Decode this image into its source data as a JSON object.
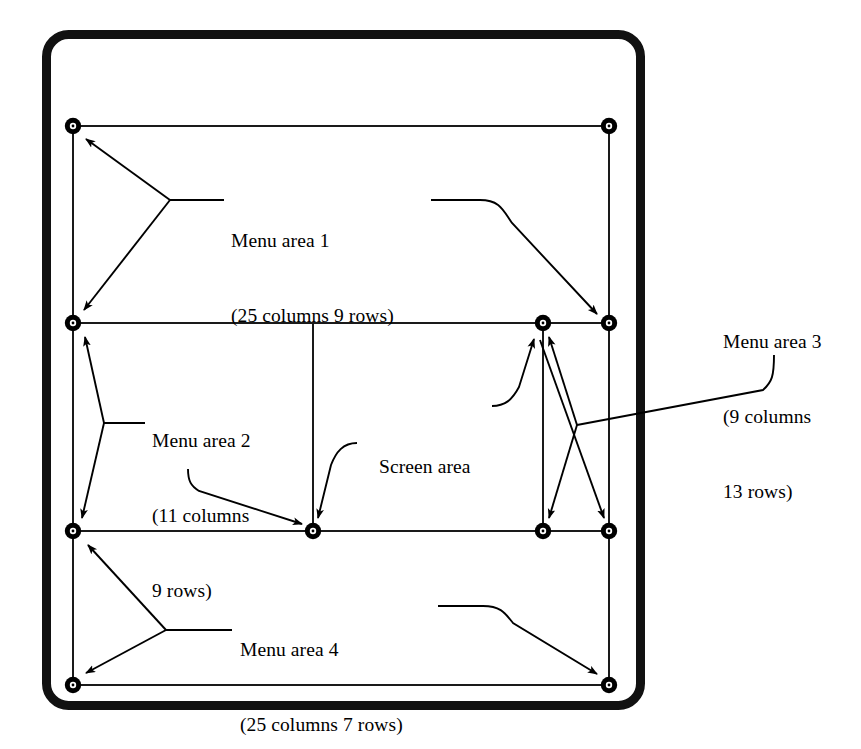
{
  "diagram": {
    "colors": {
      "ink": "#000000",
      "background": "#ffffff",
      "outer_border": "#111111"
    },
    "outer_frame": {
      "shape": "rounded-rectangle",
      "stroke_width_px": 9,
      "corner_radius_px": 22
    },
    "labels": {
      "menu_area_1": {
        "name": "Menu area 1",
        "spec_line_1": "(25 columns 9 rows)",
        "columns": 25,
        "rows": 9
      },
      "menu_area_2": {
        "name": "Menu area 2",
        "spec_line_1": "(11 columns",
        "spec_line_2": "9 rows)",
        "columns": 11,
        "rows": 9
      },
      "menu_area_3": {
        "name": "Menu area 3",
        "spec_line_1": "(9 columns",
        "spec_line_2": "13 rows)",
        "columns": 9,
        "rows": 13
      },
      "menu_area_4": {
        "name": "Menu area 4",
        "spec_line_1": "(25 columns 7 rows)",
        "columns": 25,
        "rows": 7
      },
      "screen_area": {
        "name": "Screen area"
      }
    },
    "grid": {
      "horizontal_rule_y": [
        126,
        323,
        531,
        685
      ],
      "vertical_rule_x": [
        73,
        313,
        543,
        609
      ],
      "node_markers": [
        {
          "id": "n-top-left",
          "x": 73,
          "y": 126
        },
        {
          "id": "n-top-right",
          "x": 609,
          "y": 126
        },
        {
          "id": "n-mid-left",
          "x": 73,
          "y": 323
        },
        {
          "id": "n-mid-inner-right",
          "x": 543,
          "y": 323
        },
        {
          "id": "n-mid-right",
          "x": 609,
          "y": 323
        },
        {
          "id": "n-low-left",
          "x": 73,
          "y": 531
        },
        {
          "id": "n-low-center",
          "x": 313,
          "y": 531
        },
        {
          "id": "n-low-inner-right",
          "x": 543,
          "y": 531
        },
        {
          "id": "n-low-right",
          "x": 609,
          "y": 531
        },
        {
          "id": "n-bottom-left",
          "x": 73,
          "y": 685
        },
        {
          "id": "n-bottom-right",
          "x": 609,
          "y": 685
        }
      ]
    }
  }
}
